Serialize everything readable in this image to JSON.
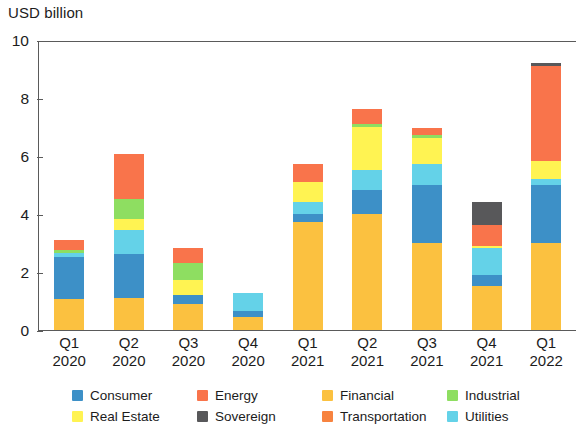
{
  "chart_data": {
    "type": "bar",
    "stacked": true,
    "title": "",
    "subtitle": "",
    "xlabel": "",
    "ylabel": "USD billion",
    "ylim": [
      0,
      10
    ],
    "yticks": [
      0,
      2,
      4,
      6,
      8,
      10
    ],
    "ytick_labels": [
      "0",
      "2",
      "4",
      "6",
      "8",
      "10"
    ],
    "grid": false,
    "legend_position": "bottom",
    "categories": [
      "Q1 2020",
      "Q2 2020",
      "Q3 2020",
      "Q4 2020",
      "Q1 2021",
      "Q2 2021",
      "Q3 2021",
      "Q4 2021",
      "Q1 2022"
    ],
    "category_lines": [
      {
        "quarter": "Q1",
        "year": "2020"
      },
      {
        "quarter": "Q2",
        "year": "2020"
      },
      {
        "quarter": "Q3",
        "year": "2020"
      },
      {
        "quarter": "Q4",
        "year": "2020"
      },
      {
        "quarter": "Q1",
        "year": "2021"
      },
      {
        "quarter": "Q2",
        "year": "2021"
      },
      {
        "quarter": "Q3",
        "year": "2021"
      },
      {
        "quarter": "Q4",
        "year": "2021"
      },
      {
        "quarter": "Q1",
        "year": "2022"
      }
    ],
    "series": [
      {
        "name": "Financial",
        "color": "#fbc140",
        "values": [
          1.05,
          1.1,
          0.9,
          0.45,
          3.7,
          4.0,
          3.0,
          1.5,
          3.0
        ]
      },
      {
        "name": "Consumer",
        "color": "#3d90c7",
        "values": [
          1.45,
          1.5,
          0.3,
          0.2,
          0.3,
          0.8,
          2.0,
          0.4,
          2.0
        ]
      },
      {
        "name": "Utilities",
        "color": "#64d2e8",
        "values": [
          0.15,
          0.85,
          0.0,
          0.6,
          0.4,
          0.7,
          0.7,
          0.9,
          0.2
        ]
      },
      {
        "name": "Real Estate",
        "color": "#fff352",
        "values": [
          0.0,
          0.35,
          0.5,
          0.0,
          0.7,
          1.5,
          0.9,
          0.1,
          0.6
        ]
      },
      {
        "name": "Industrial",
        "color": "#8ede61",
        "values": [
          0.1,
          0.7,
          0.6,
          0.0,
          0.0,
          0.1,
          0.1,
          0.0,
          0.0
        ]
      },
      {
        "name": "Energy",
        "color": "#f9744b",
        "values": [
          0.35,
          1.55,
          0.5,
          0.0,
          0.6,
          0.5,
          0.25,
          0.7,
          3.3
        ]
      },
      {
        "name": "Sovereign",
        "color": "#58585a",
        "values": [
          0.0,
          0.0,
          0.0,
          0.0,
          0.0,
          0.0,
          0.0,
          0.8,
          0.1
        ]
      },
      {
        "name": "Transportation",
        "color": "#f7833f",
        "values": [
          0.0,
          0.0,
          0.0,
          0.0,
          0.0,
          0.0,
          0.0,
          0.0,
          0.0
        ]
      }
    ],
    "totals": [
      3.1,
      6.05,
      2.8,
      1.25,
      5.7,
      7.6,
      6.95,
      4.4,
      9.2
    ]
  },
  "legend": {
    "entries": [
      {
        "label": "Consumer",
        "color": "#3d90c7"
      },
      {
        "label": "Energy",
        "color": "#f9744b"
      },
      {
        "label": "Financial",
        "color": "#fbc140"
      },
      {
        "label": "Industrial",
        "color": "#8ede61"
      },
      {
        "label": "Real Estate",
        "color": "#fff352"
      },
      {
        "label": "Sovereign",
        "color": "#58585a"
      },
      {
        "label": "Transportation",
        "color": "#f7833f"
      },
      {
        "label": "Utilities",
        "color": "#64d2e8"
      }
    ]
  },
  "colors": {
    "axis": "#5a5a5a",
    "text": "#1c1c1c",
    "background": "#ffffff"
  }
}
